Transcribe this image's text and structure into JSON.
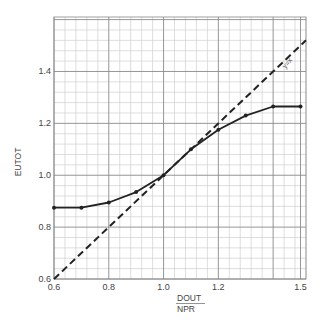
{
  "chart_data": {
    "type": "line",
    "title": "",
    "xlabel": "DOUT / NPR",
    "xlabel_numerator": "DOUT",
    "xlabel_denominator": "NPR",
    "ylabel": "EUTOT",
    "xlim": [
      0.6,
      1.52
    ],
    "ylim": [
      0.6,
      1.61
    ],
    "x_ticks": [
      {
        "value": 0.6,
        "label": "0.6"
      },
      {
        "value": 0.8,
        "label": "0.8"
      },
      {
        "value": 1.0,
        "label": "1.0"
      },
      {
        "value": 1.2,
        "label": "1.2"
      },
      {
        "value": 1.5,
        "label": "1.5"
      }
    ],
    "y_ticks": [
      {
        "value": 0.6,
        "label": "0.6"
      },
      {
        "value": 0.8,
        "label": "0.8"
      },
      {
        "value": 1.0,
        "label": "1.0"
      },
      {
        "value": 1.2,
        "label": "1.2"
      },
      {
        "value": 1.4,
        "label": "1.4"
      }
    ],
    "grid": {
      "on": true,
      "minor_step_x": 0.04,
      "minor_step_y": 0.04,
      "major_step": 0.2
    },
    "legend": null,
    "series": [
      {
        "name": "EUTOT",
        "style": "solid-with-markers",
        "color": "#222222",
        "x": [
          0.6,
          0.7,
          0.8,
          0.9,
          1.0,
          1.1,
          1.2,
          1.3,
          1.4,
          1.5
        ],
        "values": [
          0.875,
          0.875,
          0.895,
          0.935,
          1.0,
          1.1,
          1.175,
          1.23,
          1.265,
          1.265
        ]
      },
      {
        "name": "y=x",
        "style": "dashed",
        "color": "#222222",
        "x": [
          0.6,
          1.52
        ],
        "values": [
          0.6,
          1.52
        ]
      }
    ],
    "annotations": [
      {
        "text": "y=x",
        "x": 1.445,
        "y": 1.41,
        "rotation": -50
      }
    ]
  }
}
